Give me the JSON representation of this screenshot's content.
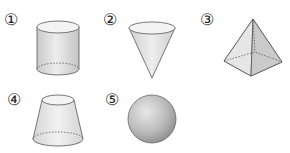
{
  "figure": {
    "items": [
      {
        "label": "①",
        "shape": "cylinder"
      },
      {
        "label": "②",
        "shape": "cone"
      },
      {
        "label": "③",
        "shape": "square-pyramid"
      },
      {
        "label": "④",
        "shape": "frustum"
      },
      {
        "label": "⑤",
        "shape": "sphere"
      }
    ]
  },
  "colors": {
    "stroke": "#555555",
    "fill_light": "#f2f2f2",
    "fill_mid": "#d9d9d9",
    "fill_dark": "#b5b5b5"
  }
}
